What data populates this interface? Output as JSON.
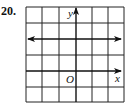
{
  "problem": {
    "number": "20."
  },
  "graph": {
    "type": "coordinate-grid",
    "grid": {
      "columns": 6,
      "rows": 6,
      "cell_px": 16.2
    },
    "axes": {
      "x_label": "x",
      "y_label": "y",
      "origin_label": "O"
    },
    "line": {
      "description": "horizontal line with arrows at both ends",
      "equation": "y = 2"
    },
    "colors": {
      "grid": "#222222",
      "line": "#111111"
    }
  }
}
